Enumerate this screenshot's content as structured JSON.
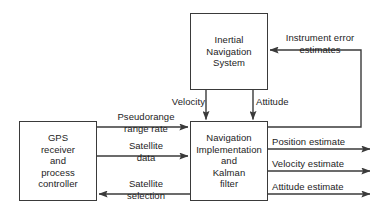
{
  "diagram": {
    "stroke_color": "#3a3a3a",
    "text_color": "#1d1d1d",
    "background_color": "#ffffff",
    "boxes": {
      "ins": {
        "label": "Inertial\nNavigation\nSystem"
      },
      "gps": {
        "label": "GPS\nreceiver\nand\nprocess\ncontroller"
      },
      "nav": {
        "label": "Navigation\nImplementation\nand\nKalman\nfilter"
      }
    },
    "edges": {
      "instrument_error": "Instrument error\nestimates",
      "velocity": "Velocity",
      "attitude": "Attitude",
      "pseudorange": "Pseudorange\nrange rate",
      "satellite_data": "Satellite\ndata",
      "satellite_selection": "Satellite\nselection",
      "position_estimate": "Position estimate",
      "velocity_estimate": "Velocity estimate",
      "attitude_estimate": "Attitude estimate"
    }
  }
}
